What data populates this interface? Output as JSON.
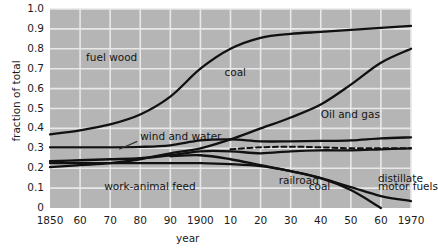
{
  "chart_data": {
    "type": "area",
    "title": "",
    "subtitle": "",
    "xlabel": "year",
    "ylabel": "fraction of total",
    "xlim": [
      1850,
      1970
    ],
    "ylim": [
      0,
      1.0
    ],
    "grid": true,
    "legend_position": "inline-labels",
    "x_tick_labels": [
      "1850",
      "60",
      "70",
      "80",
      "90",
      "1900",
      "10",
      "20",
      "30",
      "40",
      "50",
      "60",
      "1970"
    ],
    "x_tick_values": [
      1850,
      1860,
      1870,
      1880,
      1890,
      1900,
      1910,
      1920,
      1930,
      1940,
      1950,
      1960,
      1970
    ],
    "y_tick_labels": [
      "0",
      "0.1",
      "0.2",
      "0.3",
      "0.4",
      "0.5",
      "0.6",
      "0.7",
      "0.8",
      "0.9",
      "1.0"
    ],
    "y_tick_values": [
      0,
      0.1,
      0.2,
      0.3,
      0.4,
      0.5,
      0.6,
      0.7,
      0.8,
      0.9,
      1.0
    ],
    "x": [
      1850,
      1860,
      1870,
      1880,
      1890,
      1900,
      1910,
      1920,
      1930,
      1940,
      1950,
      1960,
      1970
    ],
    "series": [
      {
        "name": "top boundary (fuel wood upper edge / coal upper edge)",
        "style": "solid",
        "values": [
          0.37,
          0.39,
          0.42,
          0.47,
          0.56,
          0.7,
          0.8,
          0.855,
          0.875,
          0.885,
          0.895,
          0.905,
          0.915
        ]
      },
      {
        "name": "oil and gas upper boundary",
        "style": "solid",
        "values": [
          0.205,
          0.215,
          0.225,
          0.245,
          0.275,
          0.3,
          0.345,
          0.4,
          0.455,
          0.52,
          0.62,
          0.73,
          0.8
        ]
      },
      {
        "name": "wind and water boundary",
        "style": "solid",
        "values": [
          0.305,
          0.305,
          0.305,
          0.307,
          0.315,
          0.34,
          0.345,
          0.335,
          0.335,
          0.337,
          0.34,
          0.35,
          0.355
        ]
      },
      {
        "name": "railroad coal dashed boundary",
        "style": "dashed",
        "values": [
          null,
          null,
          null,
          null,
          null,
          null,
          0.295,
          0.305,
          0.308,
          0.305,
          0.3,
          0.3,
          0.3
        ]
      },
      {
        "name": "lower boundary (work-animal feed upper edge)",
        "style": "solid",
        "values": [
          0.235,
          0.24,
          0.245,
          0.25,
          0.265,
          0.285,
          0.285,
          0.275,
          0.285,
          0.29,
          0.29,
          0.295,
          0.3
        ]
      },
      {
        "name": "work-animal feed lower edge",
        "style": "solid",
        "values": [
          0.225,
          0.225,
          0.225,
          0.225,
          0.225,
          0.225,
          0.22,
          0.21,
          0.185,
          0.15,
          0.105,
          0.06,
          0.035
        ]
      },
      {
        "name": "railroad coal lower edge",
        "style": "solid",
        "values": [
          null,
          null,
          null,
          null,
          0.26,
          0.265,
          0.245,
          0.215,
          0.185,
          0.15,
          0.09,
          0.0,
          null
        ]
      }
    ],
    "annotations": [
      {
        "text": "fuel wood",
        "x": 1862,
        "y": 0.755
      },
      {
        "text": "coal",
        "x": 1908,
        "y": 0.68
      },
      {
        "text": "Oil and gas",
        "x": 1940,
        "y": 0.465
      },
      {
        "text": "wind and water",
        "x": 1880,
        "y": 0.355
      },
      {
        "text": "work-animal feed",
        "x": 1868,
        "y": 0.105
      },
      {
        "text": "railroad",
        "x": 1926,
        "y": 0.135
      },
      {
        "text": "coal",
        "x": 1936,
        "y": 0.105
      },
      {
        "text": "distillate",
        "x": 1959,
        "y": 0.145
      },
      {
        "text": "motor fuels",
        "x": 1959,
        "y": 0.105
      }
    ]
  },
  "style": {
    "plot_background": "#b5b5b5",
    "grid_color": "#e8e8e8",
    "line_color": "#111111",
    "text_color": "#1b1b1b",
    "page_background": "#ffffff"
  }
}
